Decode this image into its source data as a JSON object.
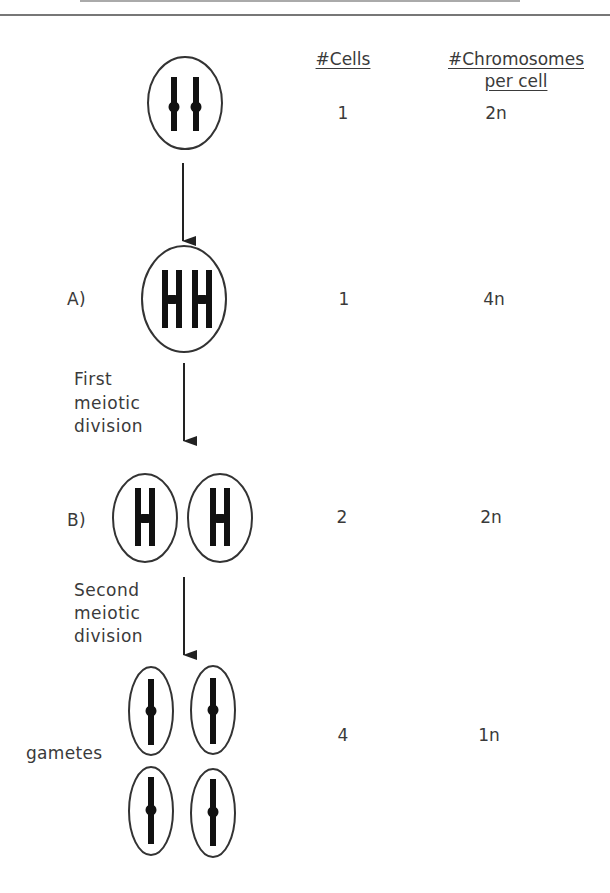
{
  "figure": {
    "title_rule_visible": true
  },
  "columns": {
    "cells_header": "#Cells",
    "chromosomes_header_line1": "#Chromosomes",
    "chromosomes_header_line2": "per cell"
  },
  "stages": [
    {
      "id": "start",
      "label": "",
      "cells": "1",
      "chromosomes": "2n",
      "cell_count_drawn": 1,
      "chromosome_shape": "single",
      "chromosomes_per_cell": 2
    },
    {
      "id": "A",
      "label": "A)",
      "cells": "1",
      "chromosomes": "4n",
      "cell_count_drawn": 1,
      "chromosome_shape": "duplicated",
      "chromosomes_per_cell": 2
    },
    {
      "id": "B",
      "label": "B)",
      "cells": "2",
      "chromosomes": "2n",
      "cell_count_drawn": 2,
      "chromosome_shape": "duplicated",
      "chromosomes_per_cell": 1
    },
    {
      "id": "gametes",
      "label": "gametes",
      "cells": "4",
      "chromosomes": "1n",
      "cell_count_drawn": 4,
      "chromosome_shape": "single",
      "chromosomes_per_cell": 1
    }
  ],
  "transitions": [
    {
      "label_lines": []
    },
    {
      "label_lines": [
        "First",
        "meiotic",
        "division"
      ]
    },
    {
      "label_lines": [
        "Second",
        "meiotic",
        "division"
      ]
    }
  ],
  "colors": {
    "outline": "#333333",
    "chromosome": "#111111",
    "text": "#3a3a3a",
    "rule": "#777777"
  }
}
